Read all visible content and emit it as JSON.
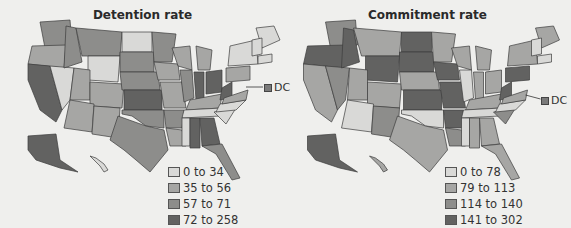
{
  "colors": {
    "c0": "#d9d9d7",
    "c1": "#a6a6a4",
    "c2": "#8d8d8b",
    "c3": "#626261",
    "border": "#3c3c3c",
    "bg": "#efefed"
  },
  "maps": [
    {
      "title": "Detention rate",
      "legend": [
        {
          "label": "0 to 34",
          "color": "#d9d9d7"
        },
        {
          "label": "35 to 56",
          "color": "#a6a6a4"
        },
        {
          "label": "57 to 71",
          "color": "#8d8d8b"
        },
        {
          "label": "72 to 258",
          "color": "#626261"
        }
      ],
      "dc": {
        "label": "DC",
        "color": "#808080"
      }
    },
    {
      "title": "Commitment rate",
      "legend": [
        {
          "label": "0 to 78",
          "color": "#d9d9d7"
        },
        {
          "label": "79 to 113",
          "color": "#a6a6a4"
        },
        {
          "label": "114 to 140",
          "color": "#8d8d8b"
        },
        {
          "label": "141 to 302",
          "color": "#626261"
        }
      ],
      "dc": {
        "label": "DC",
        "color": "#808080"
      }
    }
  ]
}
